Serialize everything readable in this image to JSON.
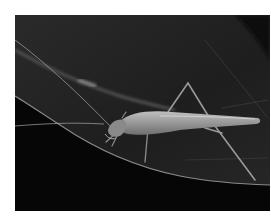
{
  "image": {
    "subject": "Tree cricket on a leaf (grayscale macro photograph)",
    "alt": "Grayscale macro photo of a long-legged tree cricket resting on a dark leaf with long thin antennae"
  },
  "colors": {
    "background": "#ffffff",
    "leaf_upper": "#262626",
    "leaf_lower": "#050505",
    "leaf_edge": "#8a8a8a",
    "insect_body": "#9a9a9a",
    "insect_highlight": "#c8c8c8"
  }
}
